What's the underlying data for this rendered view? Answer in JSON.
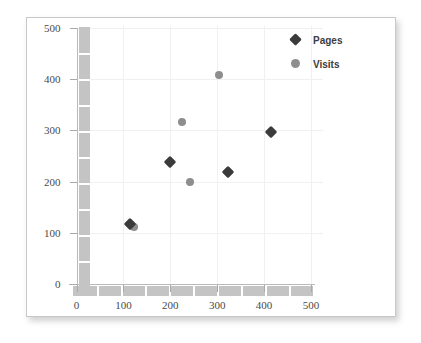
{
  "chart_data": {
    "type": "scatter",
    "title": "",
    "xlabel": "",
    "ylabel": "",
    "xlim": [
      0,
      500
    ],
    "ylim": [
      0,
      500
    ],
    "xticks": [
      "0",
      "100",
      "200",
      "300",
      "400",
      "500"
    ],
    "yticks": [
      "0",
      "100",
      "200",
      "300",
      "400",
      "500"
    ],
    "xtick_values": [
      0,
      100,
      200,
      300,
      400,
      500
    ],
    "ytick_values": [
      0,
      100,
      200,
      300,
      400,
      500
    ],
    "grid": true,
    "legend_position": "top-right",
    "series": [
      {
        "name": "Pages",
        "marker": "diamond",
        "color": "#3b3b3b",
        "points": [
          {
            "x": 115,
            "y": 118
          },
          {
            "x": 200,
            "y": 238
          },
          {
            "x": 322,
            "y": 218
          },
          {
            "x": 415,
            "y": 297
          }
        ]
      },
      {
        "name": "Visits",
        "marker": "circle",
        "color": "#8e8e8e",
        "points": [
          {
            "x": 122,
            "y": 112
          },
          {
            "x": 242,
            "y": 200
          },
          {
            "x": 225,
            "y": 317
          },
          {
            "x": 303,
            "y": 408
          }
        ]
      }
    ]
  },
  "legend": {
    "items": [
      {
        "label": "Pages",
        "marker": "diamond",
        "color": "#3b3b3b"
      },
      {
        "label": "Visits",
        "marker": "circle",
        "color": "#8e8e8e"
      }
    ]
  },
  "colors": {
    "pages": "#3b3b3b",
    "visits": "#8e8e8e",
    "axis_bar": "#c4c4c4",
    "gridline": "#eef0f2",
    "frame_border": "#c8c8c8",
    "background": "#ffffff",
    "tick_label": "#4a4a4a"
  }
}
